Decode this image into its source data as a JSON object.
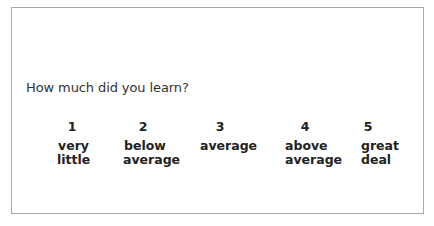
{
  "question": "How much did you learn?",
  "scale": [
    {
      "number": "1",
      "label_line1": "very",
      "label_line2": "little"
    },
    {
      "number": "2",
      "label_line1": "below",
      "label_line2": "average"
    },
    {
      "number": "3",
      "label_line1": "average",
      "label_line2": ""
    },
    {
      "number": "4",
      "label_line1": "above",
      "label_line2": "average"
    },
    {
      "number": "5",
      "label_line1": "great",
      "label_line2": "deal"
    }
  ]
}
